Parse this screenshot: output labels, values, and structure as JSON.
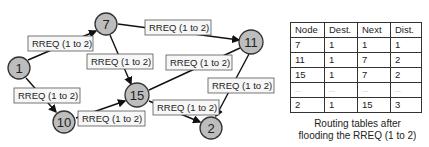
{
  "diagram": {
    "nodes": [
      {
        "id": "1",
        "label": "1",
        "x": 19,
        "y": 68
      },
      {
        "id": "7",
        "label": "7",
        "x": 106,
        "y": 24
      },
      {
        "id": "10",
        "label": "10",
        "x": 64,
        "y": 122
      },
      {
        "id": "15",
        "label": "15",
        "x": 137,
        "y": 95
      },
      {
        "id": "11",
        "label": "11",
        "x": 251,
        "y": 42
      },
      {
        "id": "2",
        "label": "2",
        "x": 211,
        "y": 128
      }
    ],
    "edges": [
      {
        "from": "1",
        "to": "7",
        "label": "RREQ (1 to 2)"
      },
      {
        "from": "1",
        "to": "10",
        "label": "RREQ (1 to 2)"
      },
      {
        "from": "7",
        "to": "15",
        "label": "RREQ (1 to 2)"
      },
      {
        "from": "7",
        "to": "11",
        "label": "RREQ (1 to 2)"
      },
      {
        "from": "10",
        "to": "15",
        "label": "RREQ (1 to 2)"
      },
      {
        "from": "15",
        "to": "11",
        "label": "RREQ (1 to 2)"
      },
      {
        "from": "15",
        "to": "2",
        "label": "RREQ (1 to 2)"
      },
      {
        "from": "11",
        "to": "2",
        "label": "RREQ (1 to 2)"
      }
    ]
  },
  "routing_table": {
    "headers": [
      "Node",
      "Dest.",
      "Next",
      "Dist."
    ],
    "rows": [
      [
        "7",
        "1",
        "1",
        "1"
      ],
      [
        "11",
        "1",
        "7",
        "2"
      ],
      [
        "15",
        "1",
        "7",
        "2"
      ],
      [
        "...",
        "...",
        "...",
        "..."
      ],
      [
        "2",
        "1",
        "15",
        "3"
      ]
    ],
    "caption_line1": "Routing tables after",
    "caption_line2": "flooding the RREQ (1 to 2)"
  }
}
